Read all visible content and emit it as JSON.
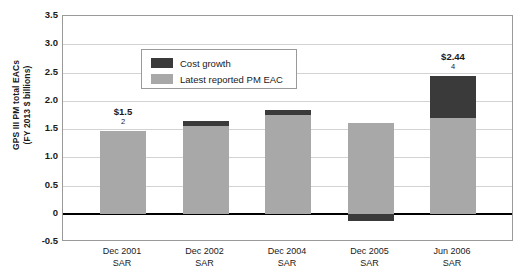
{
  "chart_data": {
    "type": "bar",
    "title": "",
    "xlabel": "",
    "ylabel": "GPS III PM total EACs (FY 2013 $ billions)",
    "ylabel_line1": "GPS III PM total EACs",
    "ylabel_line2": "(FY 2013 $ billions)",
    "ylim": [
      -0.5,
      3.5
    ],
    "ytick_values": [
      3.5,
      3.0,
      2.5,
      2.0,
      1.5,
      1.0,
      0.5,
      0,
      -0.5
    ],
    "ytick_labels": [
      "3.5",
      "3.0",
      "2.5",
      "2.0",
      "1.5",
      "1.0",
      "0.5",
      "0",
      "-0.5"
    ],
    "grid": true,
    "stacked": true,
    "legend_position": "upper-left-inside",
    "categories": [
      "Dec 2001 SAR",
      "Dec 2002 SAR",
      "Dec 2004 SAR",
      "Dec 2005 SAR",
      "Jun 2006 SAR"
    ],
    "category_lines": [
      {
        "line1": "Dec 2001",
        "line2": "SAR"
      },
      {
        "line1": "Dec 2002",
        "line2": "SAR"
      },
      {
        "line1": "Dec 2004",
        "line2": "SAR"
      },
      {
        "line1": "Dec 2005",
        "line2": "SAR"
      },
      {
        "line1": "Jun 2006",
        "line2": "SAR"
      }
    ],
    "series": [
      {
        "name": "Latest reported PM EAC",
        "color": "#a8a8a8",
        "values": [
          1.47,
          1.55,
          1.75,
          1.6,
          1.7
        ]
      },
      {
        "name": "Cost growth",
        "color": "#3a3a3a",
        "values": [
          0.0,
          0.1,
          0.08,
          -0.12,
          0.74
        ]
      }
    ],
    "totals": [
      1.47,
      1.65,
      1.83,
      1.48,
      2.44
    ],
    "annotations": [
      {
        "category": "Dec 2001 SAR",
        "amount": "$1.5",
        "note": "2"
      },
      {
        "category": "Jun 2006 SAR",
        "amount": "$2.44",
        "note": "4"
      }
    ],
    "colors": {
      "base": "#a8a8a8",
      "growth": "#3a3a3a",
      "grid": "#d3d3d3",
      "axis": "#000000",
      "frame": "#9a9a9a"
    }
  },
  "legend": {
    "items": [
      {
        "label": "Cost growth",
        "swatch": "growth-swatch"
      },
      {
        "label": "Latest reported PM EAC",
        "swatch": "base-swatch"
      }
    ]
  }
}
